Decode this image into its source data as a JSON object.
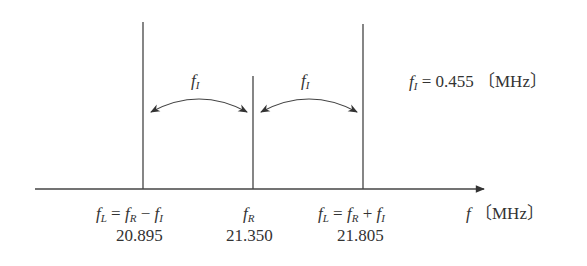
{
  "diagram": {
    "axis": {
      "label_var": "f",
      "label_unit": "〔MHz〕"
    },
    "note": {
      "var": "f",
      "sub": "I",
      "text": "= 0.455 〔MHz〕"
    },
    "arc_labels": [
      {
        "var": "f",
        "sub": "I"
      },
      {
        "var": "f",
        "sub": "I"
      }
    ],
    "lines": [
      {
        "id": "fL_minus",
        "formula_parts": [
          "f",
          "L",
          " = ",
          "f",
          "R",
          " − ",
          "f",
          "I"
        ],
        "value": "20.895"
      },
      {
        "id": "fR",
        "formula_parts": [
          "f",
          "R"
        ],
        "value": "21.350"
      },
      {
        "id": "fL_plus",
        "formula_parts": [
          "f",
          "L",
          " = ",
          "f",
          "R",
          " + ",
          "f",
          "I"
        ],
        "value": "21.805"
      }
    ]
  }
}
